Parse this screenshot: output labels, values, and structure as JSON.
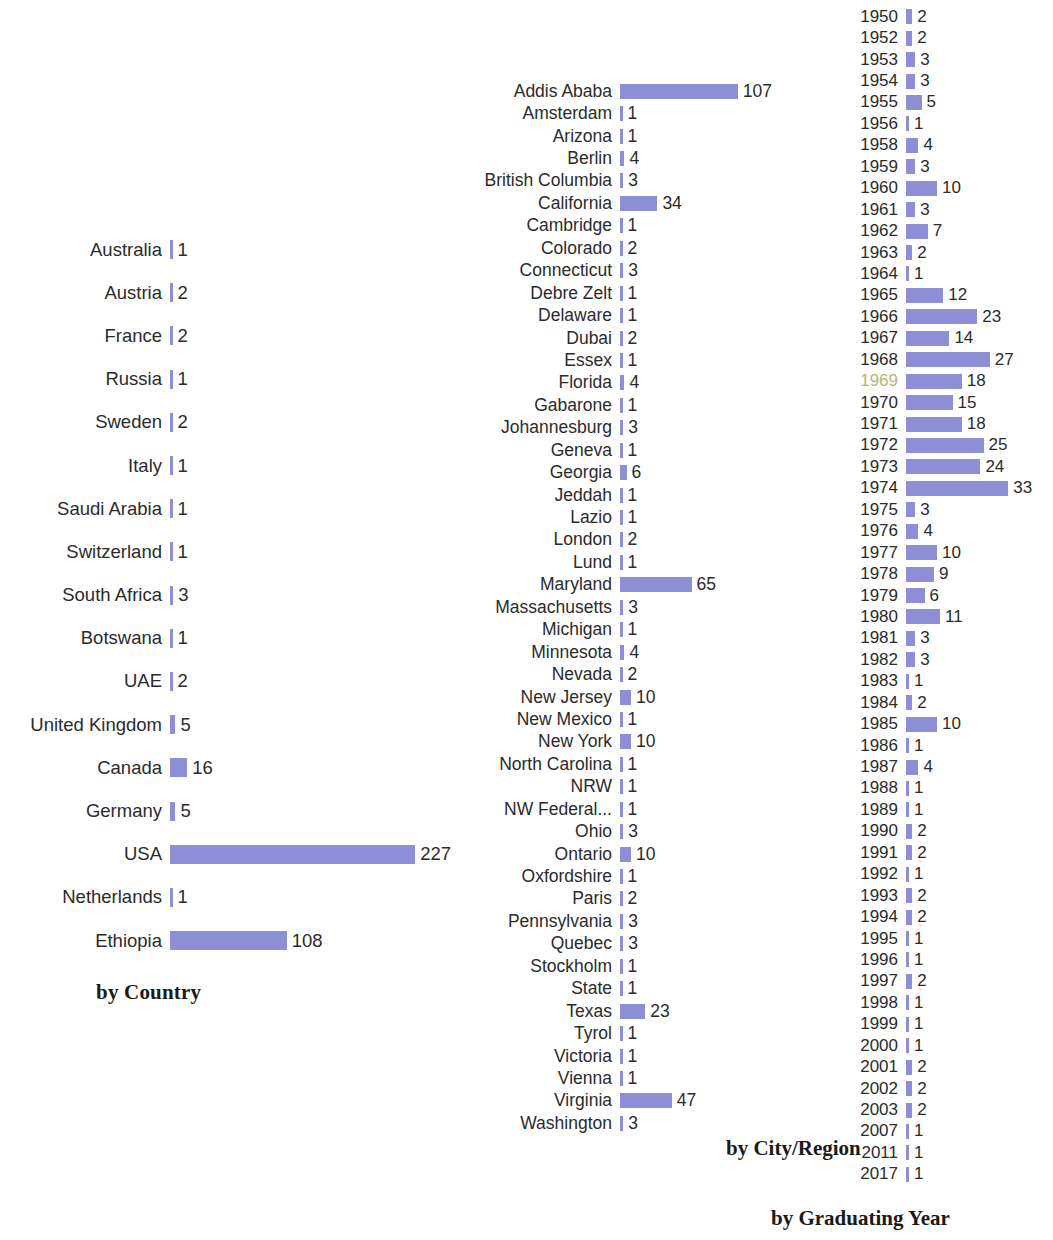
{
  "colors": {
    "bar": "#8e8ed6",
    "text": "#2b2b2b",
    "title": "#1a1a1a",
    "background": "#ffffff"
  },
  "panels": {
    "country": {
      "title": "by Country"
    },
    "city": {
      "title": "by City/Region"
    },
    "year": {
      "title": "by Graduating Year"
    }
  },
  "chart_data": [
    {
      "type": "bar",
      "orientation": "horizontal",
      "title": "by Country",
      "xlabel": "",
      "ylabel": "",
      "grid": false,
      "legend": false,
      "px_per_unit": 1.08,
      "categories": [
        "Australia",
        "Austria",
        "France",
        "Russia",
        "Sweden",
        "Italy",
        "Saudi Arabia",
        "Switzerland",
        "South Africa",
        "Botswana",
        "UAE",
        "United Kingdom",
        "Canada",
        "Germany",
        "USA",
        "Netherlands",
        "Ethiopia"
      ],
      "values": [
        1,
        2,
        2,
        1,
        2,
        1,
        1,
        1,
        3,
        1,
        2,
        5,
        16,
        5,
        227,
        1,
        108
      ]
    },
    {
      "type": "bar",
      "orientation": "horizontal",
      "title": "by City/Region",
      "xlabel": "",
      "ylabel": "",
      "grid": false,
      "legend": false,
      "px_per_unit": 1.1,
      "categories": [
        "Addis Ababa",
        "Amsterdam",
        "Arizona",
        "Berlin",
        "British Columbia",
        "California",
        "Cambridge",
        "Colorado",
        "Connecticut",
        "Debre Zelt",
        "Delaware",
        "Dubai",
        "Essex",
        "Florida",
        "Gabarone",
        "Johannesburg",
        "Geneva",
        "Georgia",
        "Jeddah",
        "Lazio",
        "London",
        "Lund",
        "Maryland",
        "Massachusetts",
        "Michigan",
        "Minnesota",
        "Nevada",
        "New Jersey",
        "New Mexico",
        "New York",
        "North Carolina",
        "NRW",
        "NW Federal...",
        "Ohio",
        "Ontario",
        "Oxfordshire",
        "Paris",
        "Pennsylvania",
        "Quebec",
        "Stockholm",
        "State",
        "Texas",
        "Tyrol",
        "Victoria",
        "Vienna",
        "Virginia",
        "Washington"
      ],
      "values": [
        107,
        1,
        1,
        4,
        3,
        34,
        1,
        2,
        3,
        1,
        1,
        2,
        1,
        4,
        1,
        3,
        1,
        6,
        1,
        1,
        2,
        1,
        65,
        3,
        1,
        4,
        2,
        10,
        1,
        10,
        1,
        1,
        1,
        3,
        10,
        1,
        2,
        3,
        3,
        1,
        1,
        23,
        1,
        1,
        1,
        47,
        3
      ]
    },
    {
      "type": "bar",
      "orientation": "horizontal",
      "title": "by Graduating Year",
      "xlabel": "",
      "ylabel": "",
      "grid": false,
      "legend": false,
      "px_per_unit": 3.1,
      "categories": [
        "1950",
        "1952",
        "1953",
        "1954",
        "1955",
        "1956",
        "1958",
        "1959",
        "1960",
        "1961",
        "1962",
        "1963",
        "1964",
        "1965",
        "1966",
        "1967",
        "1968",
        "1969",
        "1970",
        "1971",
        "1972",
        "1973",
        "1974",
        "1975",
        "1976",
        "1977",
        "1978",
        "1979",
        "1980",
        "1981",
        "1982",
        "1983",
        "1984",
        "1985",
        "1986",
        "1987",
        "1988",
        "1989",
        "1990",
        "1991",
        "1992",
        "1993",
        "1994",
        "1995",
        "1996",
        "1997",
        "1998",
        "1999",
        "2000",
        "2001",
        "2002",
        "2003",
        "2007",
        "2011",
        "2017"
      ],
      "values": [
        2,
        2,
        3,
        3,
        5,
        1,
        4,
        3,
        10,
        3,
        7,
        2,
        1,
        12,
        23,
        14,
        27,
        18,
        15,
        18,
        25,
        24,
        33,
        3,
        4,
        10,
        9,
        6,
        11,
        3,
        3,
        1,
        2,
        10,
        1,
        4,
        1,
        1,
        2,
        2,
        1,
        2,
        2,
        1,
        1,
        2,
        1,
        1,
        1,
        2,
        2,
        2,
        1,
        1,
        1
      ],
      "faded_labels": [
        "1969"
      ]
    }
  ]
}
